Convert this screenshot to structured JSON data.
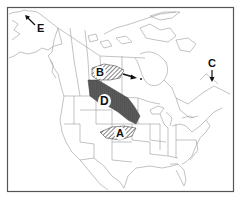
{
  "map": {
    "title": "",
    "region": "North America",
    "colors": {
      "frame": "#555555",
      "borders": "#9a9a9a",
      "hatch": "#333333",
      "dark_fill": "#5a5a5a",
      "background": "#ffffff"
    },
    "labels": [
      {
        "id": "A",
        "text": "A",
        "fill": "hatched",
        "note": "central Great Plains region"
      },
      {
        "id": "B",
        "text": "B",
        "fill": "hatched",
        "note": "northern Saskatchewan/Alberta region"
      },
      {
        "id": "C",
        "text": "C",
        "fill": "arrow",
        "note": "arrow pointing to Newfoundland area"
      },
      {
        "id": "D",
        "text": "D",
        "fill": "dark",
        "note": "prairie region, Canada/US border"
      },
      {
        "id": "E",
        "text": "E",
        "fill": "arrow",
        "note": "arrow pointing to northwest Alaska"
      }
    ]
  }
}
